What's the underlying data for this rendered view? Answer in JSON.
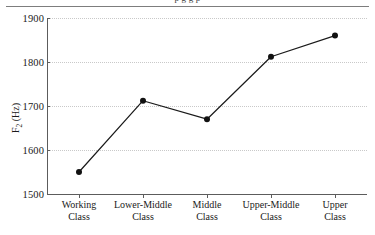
{
  "figure": {
    "caption_cutoff": "p g g p",
    "has_top_rule": true
  },
  "chart_data": {
    "type": "line",
    "title": "",
    "xlabel": "",
    "ylabel": "F2 (Hz)",
    "categories": [
      "Working Class",
      "Lower-Middle Class",
      "Middle Class",
      "Upper-Middle Class",
      "Upper Class"
    ],
    "category_lines": [
      [
        "Working",
        "Class"
      ],
      [
        "Lower-Middle",
        "Class"
      ],
      [
        "Middle",
        "Class"
      ],
      [
        "Upper-Middle",
        "Class"
      ],
      [
        "Upper",
        "Class"
      ]
    ],
    "values": [
      1550,
      1712,
      1670,
      1812,
      1860
    ],
    "ylim": [
      1500,
      1900
    ],
    "yticks": [
      1500,
      1600,
      1700,
      1800,
      1900
    ],
    "ytick_labels": [
      "1500",
      "1600",
      "1700",
      "1800",
      "1900"
    ],
    "grid": true,
    "grid_axis": "y",
    "legend": false,
    "marker": "filled-circle",
    "line_color": "#1a1a1a",
    "marker_color": "#111111",
    "grid_color": "#c9c9c9",
    "axis_color": "#5c5c5c"
  }
}
